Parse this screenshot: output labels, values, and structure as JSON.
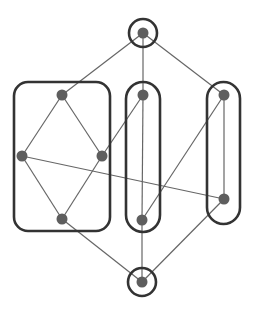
{
  "diagram": {
    "type": "hasse-diagram-with-groupings",
    "colors": {
      "background": "#ffffff",
      "edge": "#666666",
      "group_outline": "#333333",
      "node": "#5e5e5e"
    },
    "nodes": [
      {
        "id": "top",
        "x": 143,
        "y": 33
      },
      {
        "id": "a1",
        "x": 62,
        "y": 95
      },
      {
        "id": "a2",
        "x": 22,
        "y": 156
      },
      {
        "id": "a3",
        "x": 102,
        "y": 156
      },
      {
        "id": "a4",
        "x": 62,
        "y": 219
      },
      {
        "id": "b1",
        "x": 143,
        "y": 95
      },
      {
        "id": "b2",
        "x": 142,
        "y": 220
      },
      {
        "id": "c1",
        "x": 224,
        "y": 95
      },
      {
        "id": "c2",
        "x": 224,
        "y": 199
      },
      {
        "id": "bottom",
        "x": 142,
        "y": 282
      }
    ],
    "edges": [
      [
        "top",
        "a1"
      ],
      [
        "top",
        "b1"
      ],
      [
        "top",
        "c1"
      ],
      [
        "a1",
        "a2"
      ],
      [
        "a1",
        "a3"
      ],
      [
        "a2",
        "a4"
      ],
      [
        "a3",
        "a4"
      ],
      [
        "a3",
        "b1"
      ],
      [
        "a2",
        "c2"
      ],
      [
        "b1",
        "b2"
      ],
      [
        "c1",
        "b2"
      ],
      [
        "c1",
        "c2"
      ],
      [
        "a4",
        "bottom"
      ],
      [
        "b2",
        "bottom"
      ],
      [
        "c2",
        "bottom"
      ]
    ],
    "groups": [
      {
        "id": "top-circle",
        "shape": "circle",
        "cx": 143,
        "cy": 33,
        "r": 14
      },
      {
        "id": "left-box",
        "shape": "rect",
        "x": 14,
        "y": 82,
        "w": 96,
        "h": 149,
        "rx": 14
      },
      {
        "id": "middle-pill",
        "shape": "rect",
        "x": 126,
        "y": 82,
        "w": 34,
        "h": 150,
        "rx": 17
      },
      {
        "id": "right-pill",
        "shape": "rect",
        "x": 207,
        "y": 82,
        "w": 33,
        "h": 142,
        "rx": 16.5
      },
      {
        "id": "bottom-circle",
        "shape": "circle",
        "cx": 142,
        "cy": 282,
        "r": 14
      }
    ]
  }
}
